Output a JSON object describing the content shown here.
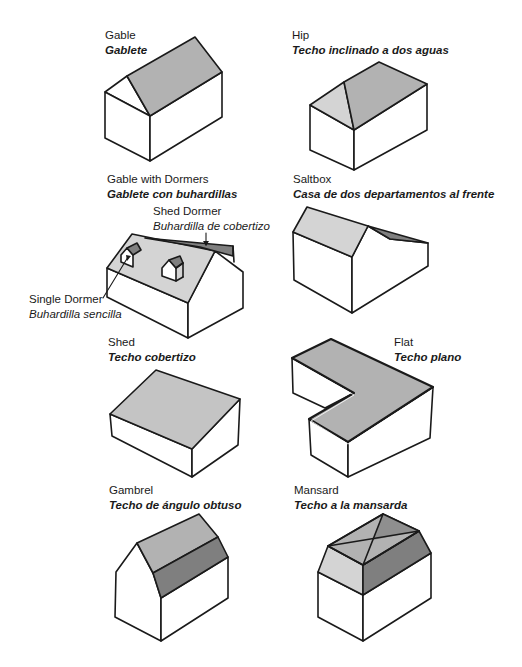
{
  "colors": {
    "stroke": "#1a1a1a",
    "roof_light": "#d4d4d4",
    "roof_mid": "#b2b2b2",
    "roof_dark": "#7f7f7f",
    "wall": "#ffffff"
  },
  "roofs": [
    {
      "id": "gable",
      "name_en": "Gable",
      "name_es": "Gablete"
    },
    {
      "id": "hip",
      "name_en": "Hip",
      "name_es": "Techo inclinado a dos aguas"
    },
    {
      "id": "gable-with-dormers",
      "name_en": "Gable with Dormers",
      "name_es": "Gablete con buhardillas",
      "callouts": [
        {
          "id": "shed-dormer",
          "name_en": "Shed Dormer",
          "name_es": "Buhardilla de cobertizo"
        },
        {
          "id": "single-dormer",
          "name_en": "Single Dormer",
          "name_es": "Buhardilla sencilla"
        }
      ]
    },
    {
      "id": "saltbox",
      "name_en": "Saltbox",
      "name_es": "Casa de dos departamentos al frente"
    },
    {
      "id": "shed",
      "name_en": "Shed",
      "name_es": "Techo cobertizo"
    },
    {
      "id": "flat",
      "name_en": "Flat",
      "name_es": "Techo plano"
    },
    {
      "id": "gambrel",
      "name_en": "Gambrel",
      "name_es": "Techo de ángulo obtuso"
    },
    {
      "id": "mansard",
      "name_en": "Mansard",
      "name_es": "Techo a la mansarda"
    }
  ]
}
